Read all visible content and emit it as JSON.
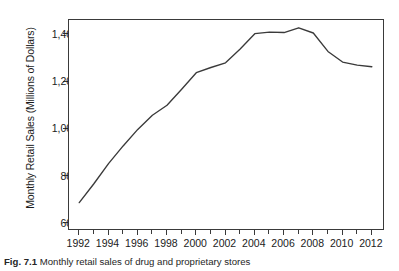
{
  "figure": {
    "caption_label": "Fig. 7.1",
    "caption_text": "Monthly retail sales of drug and proprietary stores"
  },
  "chart_data": {
    "type": "line",
    "title": "",
    "xlabel": "",
    "ylabel": "Monthly Retail Sales (Millions of Dollars)",
    "xlim": [
      1991.3,
      2012.9
    ],
    "ylim": [
      570,
      1463
    ],
    "grid": false,
    "legend": null,
    "line_color": "#3a3a3a",
    "yticks": [
      600,
      800,
      1000,
      1200,
      1400
    ],
    "ytick_labels": [
      "600",
      "800",
      "1,000",
      "1,200",
      "1,400"
    ],
    "xticks": [
      1992,
      1994,
      1996,
      1998,
      2000,
      2002,
      2004,
      2006,
      2008,
      2010,
      2012
    ],
    "xtick_labels": [
      "1992",
      "1994",
      "1996",
      "1998",
      "2000",
      "2002",
      "2004",
      "2006",
      "2008",
      "2010",
      "2012"
    ],
    "xticks_minor": [
      1993,
      1995,
      1997,
      1999,
      2001,
      2003,
      2005,
      2007,
      2009,
      2011
    ],
    "x": [
      1992,
      1993,
      1994,
      1995,
      1996,
      1997,
      1998,
      1999,
      2000,
      2001,
      2002,
      2003,
      2004,
      2005,
      2006,
      2007,
      2008,
      2009,
      2010,
      2011,
      2012
    ],
    "values": [
      690,
      770,
      855,
      930,
      1000,
      1060,
      1102,
      1170,
      1240,
      1262,
      1282,
      1340,
      1405,
      1412,
      1410,
      1430,
      1408,
      1330,
      1285,
      1272,
      1265
    ],
    "series": [
      {
        "name": "Monthly Retail Sales",
        "values": [
          690,
          770,
          855,
          930,
          1000,
          1060,
          1102,
          1170,
          1240,
          1262,
          1282,
          1340,
          1405,
          1412,
          1410,
          1430,
          1408,
          1330,
          1285,
          1272,
          1265
        ]
      }
    ]
  }
}
